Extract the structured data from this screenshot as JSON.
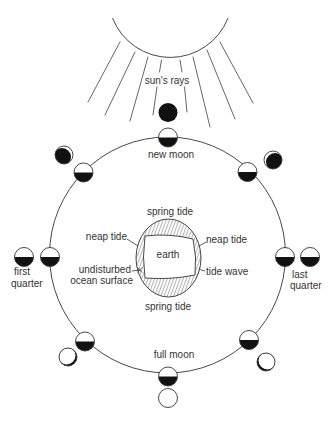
{
  "labels": {
    "sun_rays": "sun's rays",
    "new_moon": "new moon",
    "full_moon": "full moon",
    "first_quarter_line1": "first",
    "first_quarter_line2": "quarter",
    "last_quarter_line1": "last",
    "last_quarter_line2": "quarter",
    "spring_tide_top": "spring tide",
    "spring_tide_bottom": "spring tide",
    "neap_tide_left": "neap tide",
    "neap_tide_right": "neap tide",
    "earth": "earth",
    "undisturbed_line1": "undisturbed",
    "undisturbed_line2": "ocean surface",
    "tide_wave": "tide wave"
  },
  "moon_positions": [
    {
      "position": "top",
      "phase_seen_from_earth": "new moon"
    },
    {
      "position": "upper-right",
      "phase_seen_from_earth": "crescent"
    },
    {
      "position": "right",
      "phase_seen_from_earth": "last quarter"
    },
    {
      "position": "lower-right",
      "phase_seen_from_earth": "gibbous"
    },
    {
      "position": "bottom",
      "phase_seen_from_earth": "full moon"
    },
    {
      "position": "lower-left",
      "phase_seen_from_earth": "gibbous"
    },
    {
      "position": "left",
      "phase_seen_from_earth": "first quarter"
    },
    {
      "position": "upper-left",
      "phase_seen_from_earth": "crescent"
    }
  ],
  "colors": {
    "line": "#333333",
    "moon_dark": "#111111",
    "background": "#ffffff"
  }
}
